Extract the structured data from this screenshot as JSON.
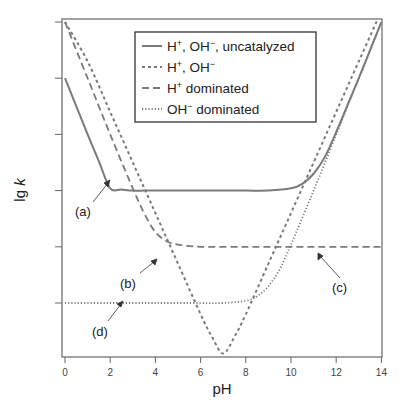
{
  "chart_data": {
    "type": "line",
    "title": "",
    "xlabel": "pH",
    "ylabel": "lg k",
    "xlim": [
      0,
      14
    ],
    "ylim": [
      -1,
      5
    ],
    "x_ticks": [
      0,
      2,
      4,
      6,
      8,
      10,
      12,
      14
    ],
    "y_ticks_unlabeled": [
      0,
      1,
      2,
      3,
      4,
      5
    ],
    "grid": false,
    "legend_position": "upper center",
    "series": [
      {
        "name": "H+, OH−, uncatalyzed",
        "style": "solid",
        "annotation": "(a)",
        "x": [
          0,
          0.5,
          1,
          1.5,
          2,
          2.5,
          3,
          3.5,
          4,
          5,
          6,
          7,
          8,
          9,
          10,
          10.5,
          11,
          11.5,
          12,
          12.5,
          13,
          13.5,
          14
        ],
        "y": [
          4.0,
          3.5,
          3.0,
          2.52,
          2.04,
          2.02,
          2.0,
          2.0,
          2.0,
          2.0,
          2.0,
          2.0,
          2.0,
          2.0,
          2.04,
          2.12,
          2.3,
          2.6,
          3.04,
          3.52,
          4.0,
          4.5,
          5.0
        ]
      },
      {
        "name": "H+, OH−",
        "style": "short-dash",
        "annotation": "(b)",
        "x": [
          0,
          1,
          2,
          3,
          4,
          5,
          6,
          6.5,
          7,
          7.5,
          8,
          9,
          10,
          11,
          12,
          13,
          14
        ],
        "y": [
          5.0,
          4.3,
          3.4,
          2.5,
          1.6,
          0.7,
          -0.2,
          -0.6,
          -0.9,
          -0.6,
          -0.2,
          0.7,
          1.6,
          2.5,
          3.4,
          4.3,
          5.2
        ]
      },
      {
        "name": "H+ dominated",
        "style": "long-dash",
        "annotation": "(c)",
        "x": [
          0,
          1,
          2,
          3,
          3.5,
          4,
          4.5,
          5,
          6,
          8,
          10,
          12,
          14
        ],
        "y": [
          5.0,
          4.0,
          3.0,
          2.04,
          1.6,
          1.26,
          1.1,
          1.04,
          1.0,
          1.0,
          1.0,
          1.0,
          1.0
        ]
      },
      {
        "name": "OH− dominated",
        "style": "dotted",
        "annotation": "(d)",
        "x": [
          0,
          2,
          4,
          6,
          7,
          8,
          8.5,
          9,
          9.5,
          10,
          11,
          12,
          13,
          14
        ],
        "y": [
          0.0,
          0.0,
          0.0,
          0.0,
          0.0,
          0.04,
          0.12,
          0.3,
          0.6,
          1.04,
          2.0,
          3.0,
          4.0,
          5.0
        ]
      }
    ]
  },
  "legend": {
    "items": [
      {
        "label_main": "H",
        "sup1": "+",
        "mid": ", OH",
        "sup2": "−",
        "rest": ", uncatalyzed",
        "style": "solid"
      },
      {
        "label_main": "H",
        "sup1": "+",
        "mid": ", OH",
        "sup2": "−",
        "rest": "",
        "style": "short-dash"
      },
      {
        "label_main": "H",
        "sup1": "+",
        "mid": " dominated",
        "sup2": "",
        "rest": "",
        "style": "long-dash"
      },
      {
        "label_main": "OH",
        "sup1": "−",
        "mid": " dominated",
        "sup2": "",
        "rest": "",
        "style": "dotted"
      }
    ]
  },
  "annotations": {
    "a": "(a)",
    "b": "(b)",
    "c": "(c)",
    "d": "(d)"
  },
  "axes": {
    "x_label": "pH",
    "y_label_main": "lg ",
    "y_label_var": "k",
    "x_tick_labels": [
      "0",
      "2",
      "4",
      "6",
      "8",
      "10",
      "12",
      "14"
    ]
  },
  "colors": {
    "curve": "#7a7a7a",
    "axis": "#555555",
    "text": "#222222"
  }
}
